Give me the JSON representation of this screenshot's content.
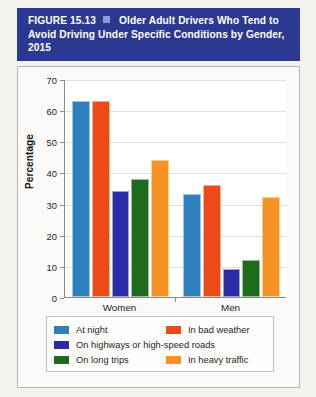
{
  "figure": {
    "label": "FIGURE 15.13",
    "marker_icon": "square-bullet-icon",
    "title": "Older Adult Drivers Who Tend to Avoid Driving Under Specific Conditions by Gender, 2015"
  },
  "colors": {
    "banner": "#2b3990",
    "at_night": "#2e81bc",
    "in_bad_weather": "#ec4a16",
    "on_highways": "#2b2ba8",
    "on_long_trips": "#1e6b1e",
    "in_heavy_traffic": "#f59324"
  },
  "chart_data": {
    "type": "bar",
    "title": "Older Adult Drivers Who Tend to Avoid Driving Under Specific Conditions by Gender, 2015",
    "xlabel": "",
    "ylabel": "Percentage",
    "ylim": [
      0,
      70
    ],
    "yticks": [
      0,
      10,
      20,
      30,
      40,
      50,
      60,
      70
    ],
    "ytick_labels": [
      "0",
      "10",
      "20",
      "30",
      "40",
      "50",
      "60",
      "70"
    ],
    "grid": true,
    "legend_position": "bottom",
    "categories": [
      "Women",
      "Men"
    ],
    "series": [
      {
        "name": "At night",
        "color": "#2e81bc",
        "values": [
          63,
          33
        ]
      },
      {
        "name": "In bad weather",
        "color": "#ec4a16",
        "values": [
          63,
          36
        ]
      },
      {
        "name": "On highways or high-speed roads",
        "color": "#2b2ba8",
        "values": [
          34,
          9
        ]
      },
      {
        "name": "On long trips",
        "color": "#1e6b1e",
        "values": [
          38,
          12
        ]
      },
      {
        "name": "In heavy traffic",
        "color": "#f59324",
        "values": [
          44,
          32
        ]
      }
    ]
  }
}
